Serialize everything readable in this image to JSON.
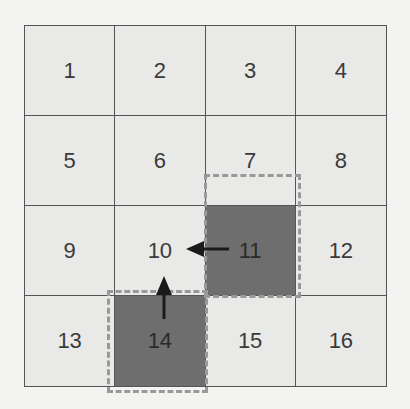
{
  "grid": {
    "rows": 4,
    "cols": 4,
    "cells": [
      "1",
      "2",
      "3",
      "4",
      "5",
      "6",
      "7",
      "8",
      "9",
      "10",
      "11",
      "12",
      "13",
      "14",
      "15",
      "16"
    ],
    "highlighted": [
      "11",
      "14"
    ]
  },
  "arrows": [
    {
      "from": "11",
      "to": "10",
      "direction": "left"
    },
    {
      "from": "14",
      "to": "10",
      "direction": "up"
    }
  ],
  "colors": {
    "cell_fill": "#e9e9e7",
    "highlight_fill": "#6e6e6e",
    "dash_outline": "#999999",
    "arrow": "#1a1a1a"
  }
}
